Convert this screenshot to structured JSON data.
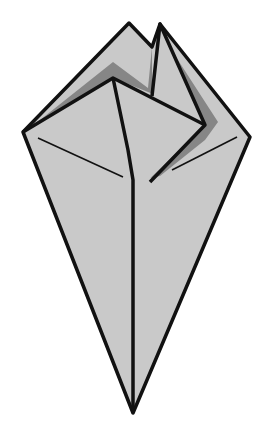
{
  "diagram": {
    "type": "origami-fold-step",
    "colors": {
      "background": "#ffffff",
      "paper": "#c9c9c9",
      "shadow": "#7a7a7a",
      "outline": "#111111"
    },
    "vertices": {
      "left_corner": [
        23,
        132
      ],
      "right_corner": [
        250,
        137
      ],
      "bottom_tip": [
        133,
        413
      ],
      "left_peak": [
        129,
        23
      ],
      "notch": [
        152,
        47
      ],
      "right_peak": [
        160,
        24
      ],
      "inner_apex": [
        113,
        78
      ],
      "flap_point": [
        205,
        125
      ],
      "center_bottom": [
        135,
        180
      ]
    }
  }
}
